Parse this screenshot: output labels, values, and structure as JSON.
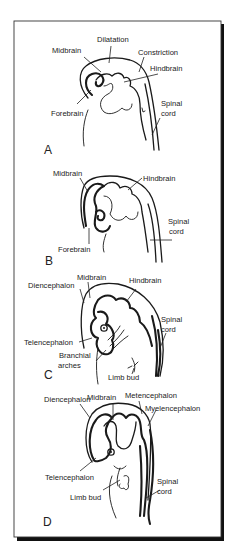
{
  "figure": {
    "panels": [
      {
        "id": "A",
        "letter": "A",
        "labels": {
          "midbrain": "Midbrain",
          "dilatation": "Dilatation",
          "constriction": "Constriction",
          "hindbrain": "Hindbrain",
          "forebrain": "Forebrain",
          "spinal_cord_1": "Spinal",
          "spinal_cord_2": "cord"
        }
      },
      {
        "id": "B",
        "letter": "B",
        "labels": {
          "midbrain": "Midbrain",
          "hindbrain": "Hindbrain",
          "forebrain": "Forebrain",
          "spinal_cord_1": "Spinal",
          "spinal_cord_2": "cord"
        }
      },
      {
        "id": "C",
        "letter": "C",
        "labels": {
          "midbrain": "Midbrain",
          "diencephalon": "Diencephalon",
          "hindbrain": "Hindbrain",
          "telencephalon": "Telencephalon",
          "branchial_1": "Branchial",
          "branchial_2": "arches",
          "limb_bud": "Limb bud",
          "spinal_cord_1": "Spinal",
          "spinal_cord_2": "cord"
        }
      },
      {
        "id": "D",
        "letter": "D",
        "labels": {
          "midbrain": "Midbrain",
          "diencephalon": "Diencephalon",
          "metencephalon": "Metencephalon",
          "myelencephalon": "Myelencephalon",
          "telencephalon": "Telencephalon",
          "limb_bud": "Limb bud",
          "spinal_cord_1": "Spinal",
          "spinal_cord_2": "cord"
        }
      }
    ]
  },
  "colors": {
    "background": "#ffffff",
    "line": "#1a1a1a",
    "frame_shadow": "#111111"
  }
}
